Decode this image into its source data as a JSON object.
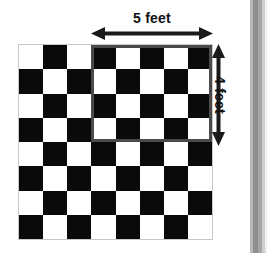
{
  "diagram": {
    "board": {
      "name": "checkerboard",
      "rows": 8,
      "columns": 8,
      "top_left_square_color": "light",
      "dark_color": "#0a0a0a",
      "light_color": "#ffffff"
    },
    "highlight_region": {
      "name": "highlighted-rectangle",
      "start_column": 3,
      "start_row": 0,
      "width_in_squares": 5,
      "height_in_squares": 4,
      "outline_color": "#4a4a4a"
    },
    "dimensions": {
      "horizontal": {
        "label": "5 feet",
        "value": 5,
        "unit": "feet",
        "orientation": "horizontal",
        "arrow_style": "double-headed"
      },
      "vertical": {
        "label": "4 feet",
        "value": 4,
        "unit": "feet",
        "orientation": "vertical",
        "arrow_style": "double-headed"
      }
    },
    "page_edge": {
      "name": "page-edge-strip",
      "colors": [
        "#ffffff",
        "#b8b8b8",
        "#8e8e8e",
        "#a6a6a6",
        "#cfcfcf",
        "#efefef"
      ]
    }
  }
}
